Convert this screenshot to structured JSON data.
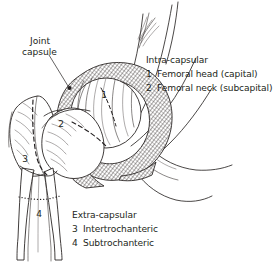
{
  "figure": {
    "background_color": "#ffffff",
    "ink_color": "#231f20"
  },
  "callouts": {
    "joint_capsule": {
      "line1": "Joint",
      "line2": "capsule"
    }
  },
  "legend_intracapsular": {
    "heading": "Intra-capsular",
    "items": [
      {
        "number": "1",
        "label": "Femoral head (capital)"
      },
      {
        "number": "2",
        "label": "Femoral neck (subcapital)"
      }
    ]
  },
  "legend_extracapsular": {
    "heading": "Extra-capsular",
    "items": [
      {
        "number": "3",
        "label": "Intertrochanteric"
      },
      {
        "number": "4",
        "label": "Subtrochanteric"
      }
    ]
  },
  "diagram_numbers": {
    "one": "1",
    "two": "2",
    "three": "3",
    "four": "4"
  }
}
